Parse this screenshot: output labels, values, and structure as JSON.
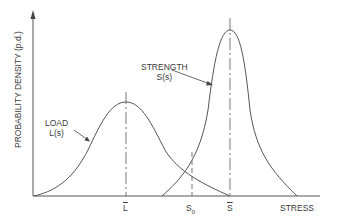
{
  "diagram": {
    "type": "load-strength interference",
    "y_axis_label": "PROBABILITY DENSITY (p.d.)",
    "x_axis_label": "STRESS",
    "curves": [
      {
        "name": "load",
        "label_line1": "LOAD",
        "label_line2": "L(s)",
        "mean_label": "L",
        "shape": "symmetric bell"
      },
      {
        "name": "strength",
        "label_line1": "STRENGTH",
        "label_line2": "S(s)",
        "mean_label": "S",
        "shape": "tall narrow peak"
      }
    ],
    "x_ticks": [
      {
        "label": "L",
        "overbar": true,
        "desc": "mean load"
      },
      {
        "label": "S",
        "sub": "0",
        "desc": "threshold stress, dashed line"
      },
      {
        "label": "S",
        "overbar": true,
        "desc": "mean strength"
      }
    ],
    "colors": {
      "line": "#555555",
      "text": "#3a3a3a",
      "background": "#ffffff"
    }
  }
}
